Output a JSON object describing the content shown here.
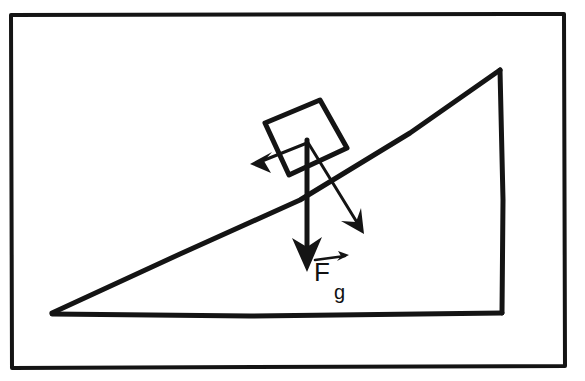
{
  "figure": {
    "background_color": "#ffffff",
    "ink_color": "#141414",
    "border": {
      "name": "outer frame",
      "x": 10,
      "y": 14,
      "width": 555,
      "height": 354,
      "stroke_width": 4
    },
    "incline": {
      "name": "inclined plane triangle",
      "stroke_width": 5,
      "apex_top": [
        500,
        70
      ],
      "corner_bottom_right": [
        502,
        313
      ],
      "corner_bottom_left": [
        52,
        313
      ],
      "angle_label": ""
    },
    "block": {
      "name": "block on incline",
      "stroke_width": 5,
      "corners": [
        [
          265,
          123
        ],
        [
          320,
          100
        ],
        [
          347,
          148
        ],
        [
          289,
          174
        ]
      ]
    },
    "vectors": [
      {
        "name": "gravity-vector",
        "label": "F",
        "subscript": "g",
        "has_overhead_arrow": true,
        "direction": "down",
        "origin": [
          307,
          140
        ],
        "tip": [
          307,
          271
        ],
        "stroke_width": 5,
        "label_position": [
          316,
          278
        ]
      },
      {
        "name": "normal-component-vector",
        "label": "",
        "subscript": "",
        "has_overhead_arrow": false,
        "direction": "down-right perpendicular to incline",
        "origin": [
          307,
          141
        ],
        "tip": [
          363,
          233
        ],
        "stroke_width": 3,
        "label_position": null
      },
      {
        "name": "parallel-component-vector",
        "label": "",
        "subscript": "",
        "has_overhead_arrow": false,
        "direction": "down-slope to the left",
        "origin": [
          307,
          143
        ],
        "tip": [
          251,
          164
        ],
        "stroke_width": 3,
        "label_position": null
      }
    ],
    "labels": {
      "force_gravity": "F",
      "force_gravity_subscript": "g"
    }
  }
}
